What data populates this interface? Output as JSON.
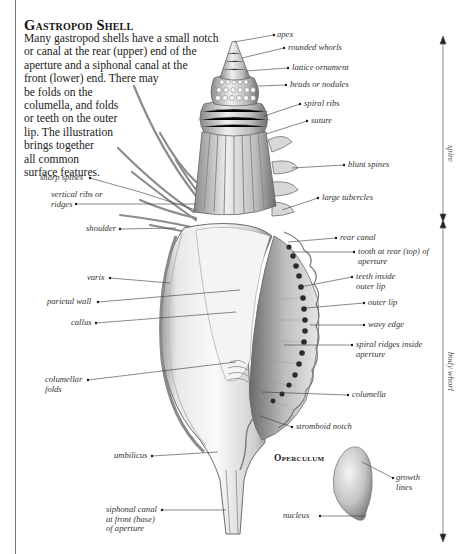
{
  "title": "Gastropod Shell",
  "intro_lines": [
    "Many gastropod shells have a small notch",
    "or canal at the rear (upper) end of the",
    "aperture and a siphonal canal at the",
    "front (lower) end. There may",
    "be folds on the",
    "columella, and folds",
    "or teeth on the outer",
    "lip. The illustration",
    "brings together",
    "all common",
    "surface features."
  ],
  "labels_right": {
    "apex": "apex",
    "rounded_whorls": "rounded whorls",
    "lattice_ornament": "lattice ornament",
    "beads_or_nodules": "beads or nodules",
    "spiral_ribs": "spiral ribs",
    "suture": "suture",
    "blunt_spines": "blunt spines",
    "large_tubercles": "large tubercles",
    "rear_canal": "rear canal",
    "tooth_at_rear": [
      "tooth at rear (top) of",
      "aperture"
    ],
    "teeth_inside_outer_lip": [
      "teeth inside",
      "outer lip"
    ],
    "outer_lip": "outer lip",
    "wavy_edge": "wavy edge",
    "spiral_ridges_inside_aperture": [
      "spiral ridges inside",
      "aperture"
    ],
    "columella": "columella",
    "stromboid_notch": "stromboid notch"
  },
  "labels_left": {
    "sharp_spines": "sharp spines",
    "vertical_ribs": [
      "vertical ribs or",
      "ridges"
    ],
    "shoulder": "shoulder",
    "varix": "varix",
    "parietal_wall": "parietal wall",
    "callus": "callus",
    "columellar_folds": [
      "columellar",
      "folds"
    ],
    "umbilicus": "umbilicus",
    "siphonal_canal": [
      "siphonal canal",
      "at front (base)",
      "of aperture"
    ]
  },
  "operculum": {
    "title": "Operculum",
    "growth_lines": [
      "growth",
      "lines"
    ],
    "nucleus": "nucleus"
  },
  "dimensions": {
    "spire": "spire",
    "body_whorl": "body whorl"
  },
  "colors": {
    "line": "#333333",
    "shell_light": "#f2f2f2",
    "shell_mid": "#c8c8c8",
    "shell_dark": "#7a7a7a",
    "teeth": "#2b2b2b"
  }
}
